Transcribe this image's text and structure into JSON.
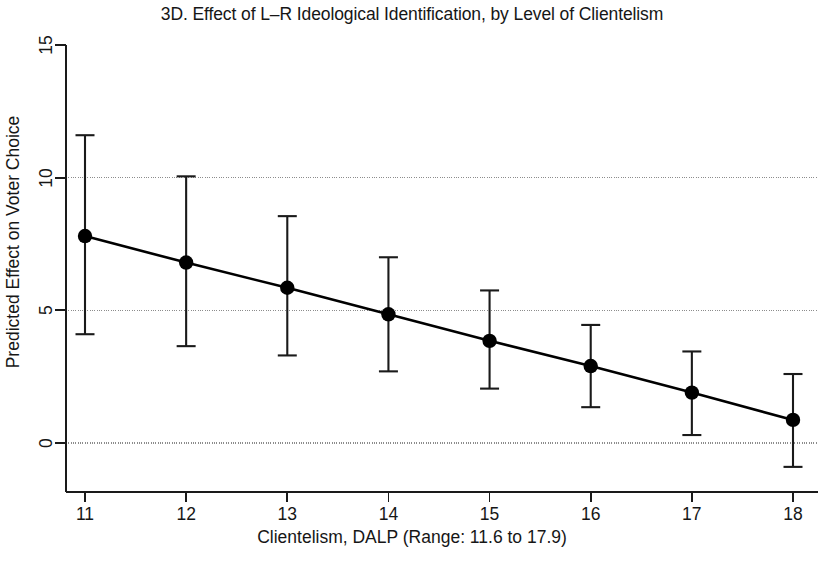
{
  "chart_data": {
    "type": "line",
    "title": "3D. Effect of L–R Ideological Identification, by Level of Clientelism",
    "xlabel": "Clientelism, DALP (Range: 11.6 to 17.9)",
    "ylabel": "Predicted Effect on Voter Choice",
    "x": [
      11,
      12,
      13,
      14,
      15,
      16,
      17,
      18
    ],
    "values": [
      7.8,
      6.8,
      5.85,
      4.85,
      3.85,
      2.9,
      1.9,
      0.87
    ],
    "ci_lower": [
      4.1,
      3.65,
      3.3,
      2.7,
      2.05,
      1.35,
      0.3,
      -0.9
    ],
    "ci_upper": [
      11.6,
      10.05,
      8.55,
      7.0,
      5.75,
      4.45,
      3.45,
      2.6
    ],
    "xticks": [
      11,
      12,
      13,
      14,
      15,
      16,
      17,
      18
    ],
    "xtick_labels": [
      "11",
      "12",
      "13",
      "14",
      "15",
      "16",
      "17",
      "18"
    ],
    "yticks": [
      0,
      5,
      10,
      15
    ],
    "ytick_labels": [
      "0",
      "5",
      "10",
      "15"
    ],
    "xlim": [
      10.72,
      18.3
    ],
    "ylim": [
      -1.85,
      15.6
    ],
    "grid": "horizontal-dotted",
    "gridlines_at": [
      0,
      5,
      10
    ],
    "legend": null,
    "series_name": "Predicted effect with 95% CI",
    "marker": "filled-circle",
    "colors": {
      "line": "#000000",
      "marker": "#000000",
      "errorbar": "#1a1a1a",
      "grid": "#8c8c8c",
      "axis": "#1a1a1a",
      "background": "#ffffff",
      "text": "#161616"
    }
  }
}
